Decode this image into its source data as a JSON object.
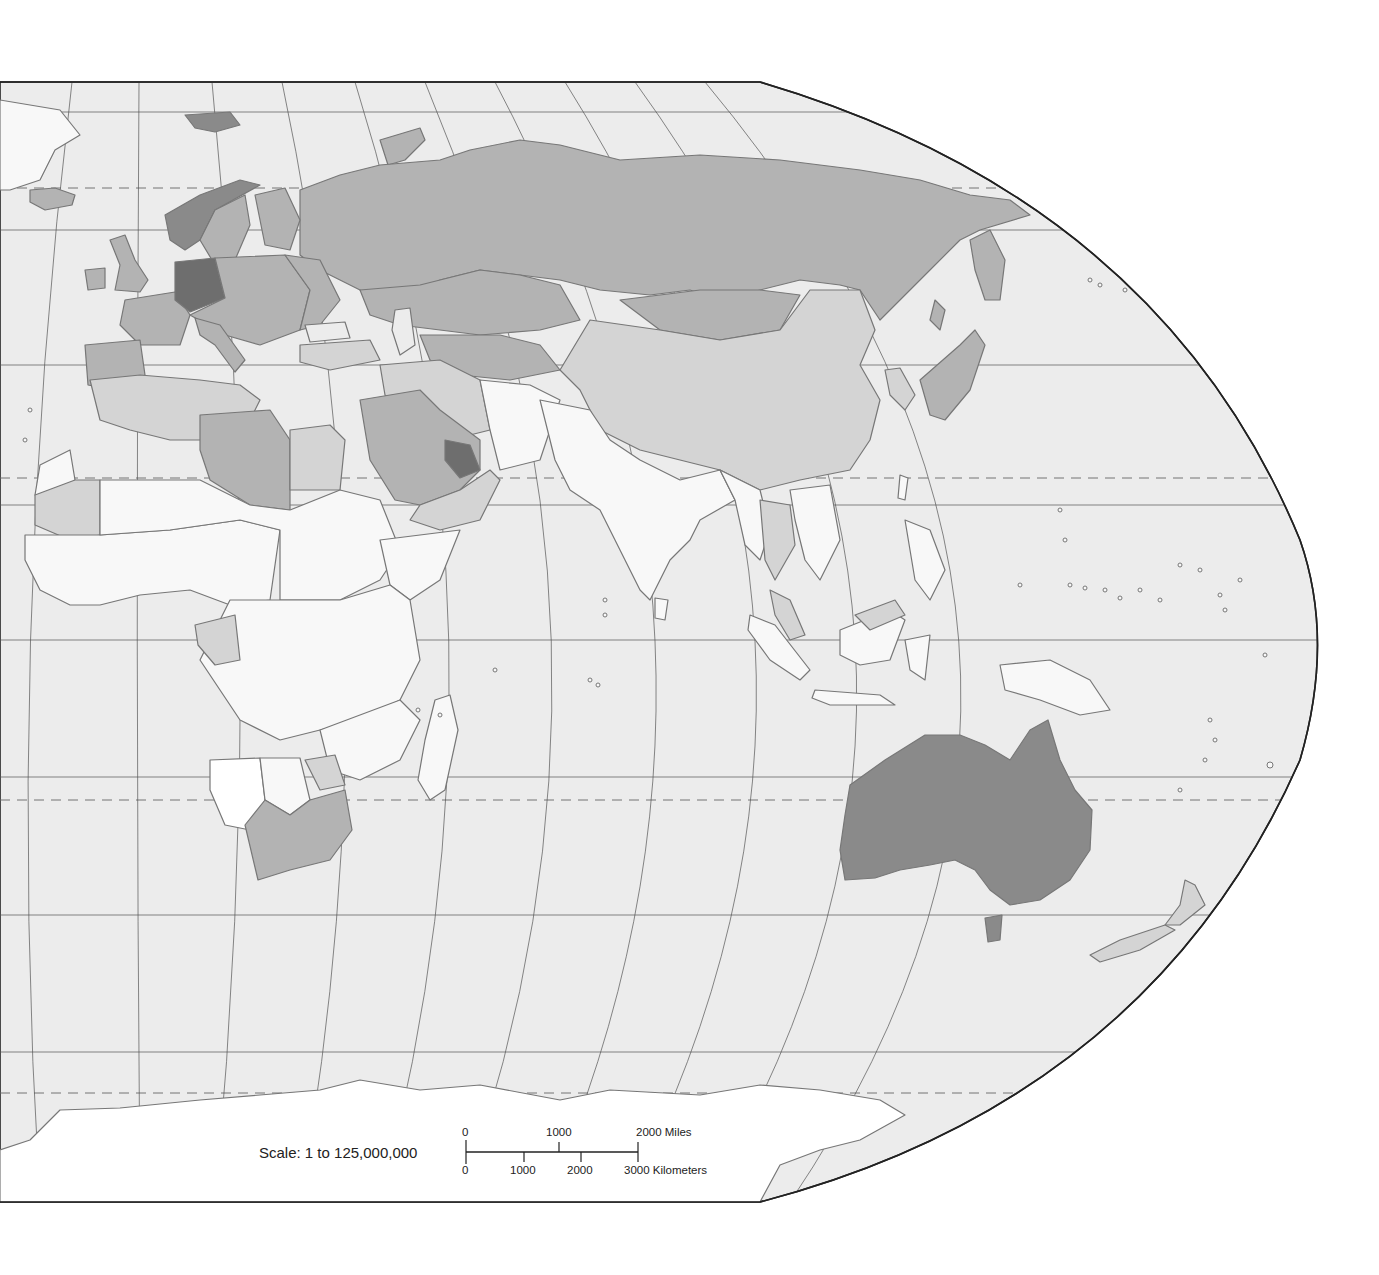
{
  "map": {
    "title": "",
    "projection": "Robinson (eastern hemisphere section)",
    "colors": {
      "ocean": "#ececec",
      "frame": "#222222",
      "graticule": "#555555",
      "coast": "#777777",
      "white_country": "#f8f8f8",
      "light_country": "#d4d4d4",
      "medium_country": "#b3b3b3",
      "dark_country": "#8a8a8a",
      "darkest_country": "#6e6e6e",
      "antarctica": "#ffffff"
    },
    "shading_legend_visible": false
  },
  "scale": {
    "label": "Scale:  1 to 125,000,000",
    "miles": {
      "ticks": [
        "0",
        "1000",
        "2000 Miles"
      ]
    },
    "kilometers": {
      "ticks": [
        "0",
        "1000",
        "2000",
        "3000 Kilometers"
      ]
    }
  }
}
